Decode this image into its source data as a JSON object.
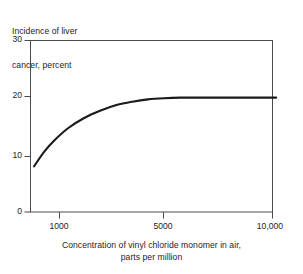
{
  "chart_data": {
    "type": "line",
    "title": "",
    "ylabel": "Incidence of liver cancer, percent",
    "ylabel_lines": [
      "Incidence of liver",
      "cancer, percent"
    ],
    "xlabel": "Concentration of vinyl chloride monomer in air, parts per million",
    "xlabel_lines": [
      "Concentration of vinyl chloride monomer in air,",
      "parts per million"
    ],
    "ylim": [
      0,
      30
    ],
    "yticks": [
      0,
      10,
      20,
      30
    ],
    "ytick_labels": [
      "0",
      "10",
      "20",
      "30"
    ],
    "xlim": [
      700,
      10600
    ],
    "xticks": [
      1000,
      5000,
      10000
    ],
    "xtick_labels": [
      "1000",
      "5000",
      "10,000"
    ],
    "grid": false,
    "legend": null,
    "series": [
      {
        "name": "Incidence of liver cancer",
        "color": "#1a1a1a",
        "x": [
          760,
          850,
          950,
          1100,
          1300,
          1550,
          1850,
          2200,
          2600,
          3100,
          3700,
          4400,
          5200,
          6200,
          7400,
          8800,
          10400
        ],
        "y": [
          8.0,
          10.6,
          12.6,
          14.7,
          16.4,
          17.7,
          18.7,
          19.3,
          19.7,
          19.9,
          20.0,
          20.0,
          20.0,
          20.0,
          20.0,
          20.0,
          20.0
        ]
      }
    ],
    "annotations": [
      "Curve rises steeply from about 8 percent near 760 ppm and saturates at a plateau of 20 percent above roughly 3000 ppm."
    ]
  },
  "axes": {
    "y_tick_label_0": "0",
    "y_tick_label_1": "10",
    "y_tick_label_2": "20",
    "y_tick_label_3": "30",
    "x_tick_label_0": "1000",
    "x_tick_label_1": "5000",
    "x_tick_label_2": "10,000"
  },
  "labels": {
    "y_title_line1": "Incidence of liver",
    "y_title_line2": "cancer, percent",
    "x_title_line1": "Concentration of vinyl chloride monomer in air,",
    "x_title_line2": "parts per million"
  },
  "colors": {
    "background": "#ffffff",
    "axis": "#4a4a4a",
    "curve": "#1a1a1a",
    "text": "#1d1d1d"
  }
}
